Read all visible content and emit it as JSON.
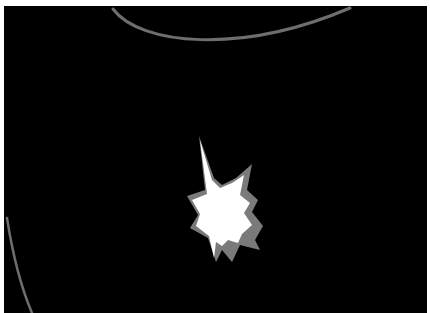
{
  "scene": {
    "background": "#000000",
    "border_color": "#ffffff",
    "elements": [
      {
        "name": "top-arc",
        "color": "#6e6e6e"
      },
      {
        "name": "left-curve",
        "color": "#6e6e6e"
      },
      {
        "name": "starburst",
        "core_color": "#ffffff",
        "shadow_color": "#7a7a7a"
      }
    ]
  }
}
